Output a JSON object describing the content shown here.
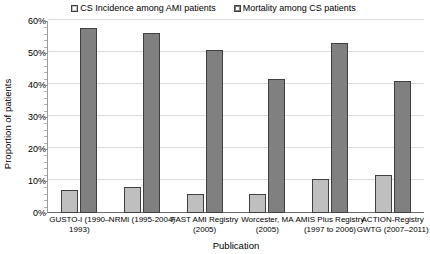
{
  "chart_data": {
    "type": "bar",
    "title": "",
    "subtitle": "",
    "xlabel": "Publication",
    "ylabel": "Proportion of patients",
    "ylim": [
      0,
      60
    ],
    "ytick_labels": [
      "0%",
      "10%",
      "20%",
      "30%",
      "40%",
      "50%",
      "60%"
    ],
    "ytick_values": [
      0,
      10,
      20,
      30,
      40,
      50,
      60
    ],
    "minor_tick_step": 2,
    "grid": true,
    "grid_axis": "y",
    "legend_position": "top-center",
    "categories": [
      "GUSTO-I (1990–1993)",
      "NRMI (1995-2004)",
      "FAST AMI Registry (2005)",
      "Worcester, MA (2005)",
      "AMIS Plus Registry (1997 to 2006)",
      "ACTION-Registry GWTG (2007–2011)"
    ],
    "category_lines": [
      [
        "GUSTO-I (1990–",
        "1993)"
      ],
      [
        "NRMI (1995-2004)"
      ],
      [
        "FAST AMI Registry",
        "(2005)"
      ],
      [
        "Worcester, MA",
        "(2005)"
      ],
      [
        "AMIS Plus Registry",
        "(1997 to 2006)"
      ],
      [
        "ACTION-Registry",
        "GWTG (2007–2011)"
      ]
    ],
    "series": [
      {
        "name": "CS Incidence among AMI patients",
        "color": "#bfbfbf",
        "values": [
          7.2,
          8.2,
          6.0,
          6.0,
          10.5,
          12.0
        ]
      },
      {
        "name": "Mortality among CS patients",
        "color": "#808080",
        "values": [
          57.8,
          56.2,
          51.0,
          42.0,
          53.0,
          41.3
        ]
      }
    ]
  },
  "legend": {
    "items": [
      {
        "label": "CS Incidence among AMI patients",
        "swatch": "light"
      },
      {
        "label": "Mortality among CS patients",
        "swatch": "dark"
      }
    ]
  },
  "axes": {
    "y_title": "Proportion of patients",
    "x_title": "Publication"
  },
  "colors": {
    "incidence": "#bfbfbf",
    "mortality": "#808080",
    "bar_border": "#3f3f3f",
    "gridline": "#d9d9d9",
    "axis": "#6b6b6b",
    "background": "#ffffff"
  }
}
